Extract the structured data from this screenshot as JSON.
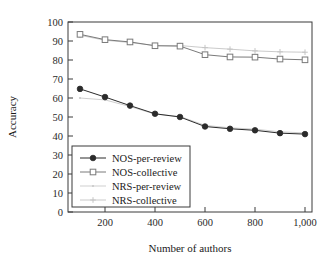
{
  "chart_data": {
    "type": "line",
    "title": "",
    "xlabel": "Number of authors",
    "ylabel": "Accuracy",
    "xlim": [
      100,
      1000
    ],
    "ylim": [
      0,
      100
    ],
    "grid": false,
    "legend_position": "lower-left",
    "x": [
      100,
      200,
      300,
      400,
      500,
      600,
      700,
      800,
      900,
      1000
    ],
    "xticks": [
      "200",
      "400",
      "600",
      "800",
      "1,000"
    ],
    "xtick_values": [
      200,
      400,
      600,
      800,
      1000
    ],
    "yticks": [
      "0",
      "10",
      "20",
      "30",
      "40",
      "50",
      "60",
      "70",
      "80",
      "90",
      "100"
    ],
    "ytick_values": [
      0,
      10,
      20,
      30,
      40,
      50,
      60,
      70,
      80,
      90,
      100
    ],
    "series": [
      {
        "name": "NOS-per-review",
        "marker": "filled-circle",
        "color": "#2b2b2b",
        "values": [
          64.8,
          60.5,
          56.0,
          51.7,
          50.0,
          45.0,
          43.8,
          43.0,
          41.5,
          41.0
        ]
      },
      {
        "name": "NOS-collective",
        "marker": "open-square",
        "color": "#7a7a7a",
        "values": [
          93.5,
          90.7,
          89.5,
          87.5,
          87.3,
          82.8,
          81.6,
          81.5,
          80.5,
          80.1
        ]
      },
      {
        "name": "NRS-per-review",
        "marker": "dot",
        "color": "#c9c9c9",
        "values": [
          60.0,
          59.0,
          55.5,
          51.5,
          50.3,
          45.6,
          44.3,
          43.6,
          42.2,
          41.6
        ]
      },
      {
        "name": "NRS-collective",
        "marker": "plus",
        "color": "#c4c4c4",
        "values": [
          93.0,
          90.4,
          89.2,
          87.6,
          87.6,
          86.5,
          85.7,
          84.8,
          84.3,
          84.1
        ]
      }
    ]
  },
  "legend": {
    "entries": [
      {
        "label": "NOS-per-review"
      },
      {
        "label": "NOS-collective"
      },
      {
        "label": "NRS-per-review"
      },
      {
        "label": "NRS-collective"
      }
    ]
  },
  "axes": {
    "x_title": "Number of authors",
    "y_title": "Accuracy"
  }
}
